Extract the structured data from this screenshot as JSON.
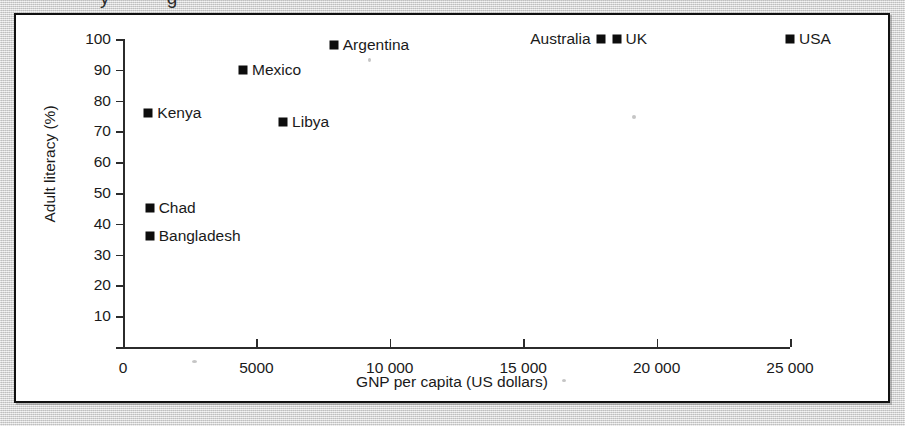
{
  "figure": {
    "cutoff_text_above": "y g",
    "panel_background": "#ffffff",
    "border_color": "#111111",
    "page_background": "#d6d6d6"
  },
  "chart_data": {
    "type": "scatter",
    "title": "",
    "xlabel": "GNP per capita (US dollars)",
    "ylabel": "Adult literacy (%)",
    "xlim": [
      0,
      25000
    ],
    "ylim": [
      0,
      100
    ],
    "grid": false,
    "legend": "none",
    "marker_color": "#0d0d0d",
    "marker_shape": "square",
    "xticks": [
      0,
      5000,
      10000,
      15000,
      20000,
      25000
    ],
    "xtick_labels": [
      "0",
      "5000",
      "10 000",
      "15 000",
      "20 000",
      "25 000"
    ],
    "yticks": [
      10,
      20,
      30,
      40,
      50,
      60,
      70,
      80,
      90,
      100
    ],
    "ytick_labels": [
      "10",
      "20",
      "30",
      "40",
      "50",
      "60",
      "70",
      "80",
      "90",
      "100"
    ],
    "points": [
      {
        "name": "Kenya",
        "x": 950,
        "y": 76,
        "label_side": "right"
      },
      {
        "name": "Chad",
        "x": 1000,
        "y": 45,
        "label_side": "right"
      },
      {
        "name": "Bangladesh",
        "x": 1000,
        "y": 36,
        "label_side": "right"
      },
      {
        "name": "Mexico",
        "x": 4500,
        "y": 90,
        "label_side": "right"
      },
      {
        "name": "Libya",
        "x": 6000,
        "y": 73,
        "label_side": "right"
      },
      {
        "name": "Argentina",
        "x": 7900,
        "y": 98,
        "label_side": "right"
      },
      {
        "name": "Australia",
        "x": 17900,
        "y": 100,
        "label_side": "left"
      },
      {
        "name": "UK",
        "x": 18500,
        "y": 100,
        "label_side": "right"
      },
      {
        "name": "USA",
        "x": 25000,
        "y": 100,
        "label_side": "right"
      }
    ]
  }
}
